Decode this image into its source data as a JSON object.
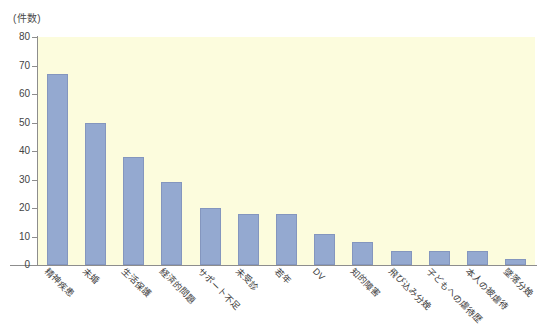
{
  "chart_data": {
    "type": "bar",
    "title": "",
    "subtitle": "",
    "xlabel": "",
    "ylabel": "(件数)",
    "ylim": [
      0,
      80
    ],
    "ytick_step": 10,
    "yticks": [
      0,
      10,
      20,
      30,
      40,
      50,
      60,
      70,
      80
    ],
    "ytick_labels": [
      "0",
      "10",
      "20",
      "30",
      "40",
      "50",
      "60",
      "70",
      "80"
    ],
    "grid": false,
    "legend": null,
    "legend_position": "none",
    "categories": [
      "精神疾患",
      "未婚",
      "生活保護",
      "経済的問題",
      "サポート不足",
      "未受診",
      "若年",
      "DV",
      "知的障害",
      "飛び込み分娩",
      "子どもへの虐待歴",
      "本人の被虐待",
      "墜落分娩"
    ],
    "values": [
      67,
      50,
      38,
      29,
      20,
      18,
      18,
      11,
      8,
      5,
      5,
      5,
      2
    ],
    "colors": {
      "bar_fill": "#94a9d0",
      "bar_edge": "#8496be",
      "plot_background": "#fcfcdd",
      "figure_background": "#ffffff",
      "axis_line": "#8d8d8d",
      "tick_text": "#444444"
    }
  }
}
